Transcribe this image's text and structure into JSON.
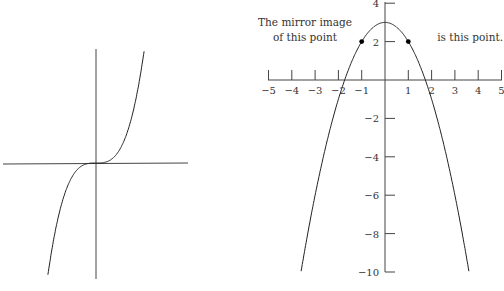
{
  "chart_data": [
    {
      "type": "line",
      "title": "",
      "description": "Cubic curve y = x^3 through the origin, no ticks or labels",
      "function": "y = x^3",
      "xlabel": "",
      "ylabel": "",
      "grid": false,
      "axes_labels_shown": false
    },
    {
      "type": "line",
      "title": "",
      "function": "y = 3 - x^2",
      "x_ticks": [
        "-5",
        "-4",
        "-3",
        "-2",
        "-1",
        "1",
        "2",
        "3",
        "4",
        "5"
      ],
      "y_ticks": [
        "4",
        "2",
        "-2",
        "-4",
        "-6",
        "-8",
        "-10"
      ],
      "xlim": [
        -5,
        5
      ],
      "ylim": [
        -10,
        4
      ],
      "grid": false,
      "points": [
        {
          "x": -1,
          "y": 2
        },
        {
          "x": 1,
          "y": 2
        }
      ],
      "annotations": [
        {
          "text_line1": "The mirror image",
          "text_line2": "of this point",
          "target": {
            "x": -1,
            "y": 2
          }
        },
        {
          "text_line1": "is this point.",
          "target": {
            "x": 1,
            "y": 2
          }
        }
      ]
    }
  ],
  "labels": {
    "left_annotation_line1": "The mirror image",
    "left_annotation_line2": "of this point",
    "right_annotation": "is this point.",
    "x_ticks": [
      "-5",
      "-4",
      "-3",
      "-2",
      "-1",
      "1",
      "2",
      "3",
      "4",
      "5"
    ],
    "y_ticks": [
      "4",
      "2",
      "-2",
      "-4",
      "-6",
      "-8",
      "-10"
    ]
  }
}
